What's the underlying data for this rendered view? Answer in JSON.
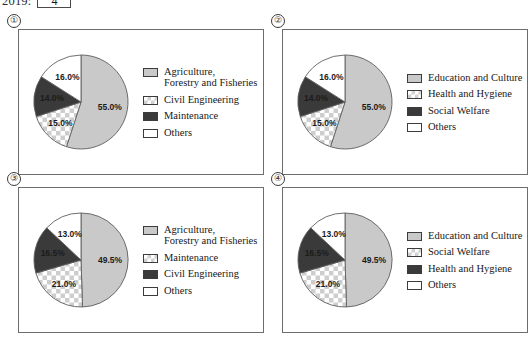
{
  "header": {
    "year_label": "2019:",
    "answer_value": "4",
    "answer_placeholder": ""
  },
  "palette": {
    "light_gray": "#c9c9c9",
    "checker_gray": "#cdcdcd",
    "dark_gray": "#3a3a3a",
    "white": "#ffffff",
    "border": "#6d6d6d",
    "text": "#181818"
  },
  "panels": [
    {
      "number": "①",
      "chart_data": {
        "type": "pie",
        "title": "",
        "labels": [
          "55.0%",
          "15.0%",
          "14.0%",
          "16.0%"
        ],
        "values": [
          55.0,
          15.0,
          14.0,
          16.0
        ],
        "categories": [
          "Agriculture, Forestry and Fisheries",
          "Civil Engineering",
          "Maintenance",
          "Others"
        ],
        "fills": [
          "light",
          "check",
          "dark",
          "white"
        ],
        "start_angle_deg": 0,
        "direction": "clockwise",
        "legend_position": "right"
      },
      "legend": [
        {
          "swatch": "light",
          "label": "Agriculture,\nForestry and Fisheries"
        },
        {
          "swatch": "check",
          "label": "Civil Engineering"
        },
        {
          "swatch": "dark",
          "label": "Maintenance"
        },
        {
          "swatch": "white",
          "label": "Others"
        }
      ]
    },
    {
      "number": "②",
      "chart_data": {
        "type": "pie",
        "title": "",
        "labels": [
          "55.0%",
          "15.0%",
          "14.0%",
          "16.0%"
        ],
        "values": [
          55.0,
          15.0,
          14.0,
          16.0
        ],
        "categories": [
          "Education and Culture",
          "Health and Hygiene",
          "Social Welfare",
          "Others"
        ],
        "fills": [
          "light",
          "check",
          "dark",
          "white"
        ],
        "start_angle_deg": 0,
        "direction": "clockwise",
        "legend_position": "right"
      },
      "legend": [
        {
          "swatch": "light",
          "label": "Education and Culture"
        },
        {
          "swatch": "check",
          "label": "Health and Hygiene"
        },
        {
          "swatch": "dark",
          "label": "Social Welfare"
        },
        {
          "swatch": "white",
          "label": "Others"
        }
      ]
    },
    {
      "number": "③",
      "chart_data": {
        "type": "pie",
        "title": "",
        "labels": [
          "49.5%",
          "21.0%",
          "16.5%",
          "13.0%"
        ],
        "values": [
          49.5,
          21.0,
          16.5,
          13.0
        ],
        "categories": [
          "Agriculture, Forestry and Fisheries",
          "Maintenance",
          "Civil Engineering",
          "Others"
        ],
        "fills": [
          "light",
          "check",
          "dark",
          "white"
        ],
        "start_angle_deg": 0,
        "direction": "clockwise",
        "legend_position": "right"
      },
      "legend": [
        {
          "swatch": "light",
          "label": "Agriculture,\nForestry and Fisheries"
        },
        {
          "swatch": "check",
          "label": "Maintenance"
        },
        {
          "swatch": "dark",
          "label": "Civil Engineering"
        },
        {
          "swatch": "white",
          "label": "Others"
        }
      ]
    },
    {
      "number": "④",
      "chart_data": {
        "type": "pie",
        "title": "",
        "labels": [
          "49.5%",
          "21.0%",
          "16.5%",
          "13.0%"
        ],
        "values": [
          49.5,
          21.0,
          16.5,
          13.0
        ],
        "categories": [
          "Education and Culture",
          "Social Welfare",
          "Health and Hygiene",
          "Others"
        ],
        "fills": [
          "light",
          "check",
          "dark",
          "white"
        ],
        "start_angle_deg": 0,
        "direction": "clockwise",
        "legend_position": "right"
      },
      "legend": [
        {
          "swatch": "light",
          "label": "Education and Culture"
        },
        {
          "swatch": "check",
          "label": "Social Welfare"
        },
        {
          "swatch": "dark",
          "label": "Health and Hygiene"
        },
        {
          "swatch": "white",
          "label": "Others"
        }
      ]
    }
  ]
}
